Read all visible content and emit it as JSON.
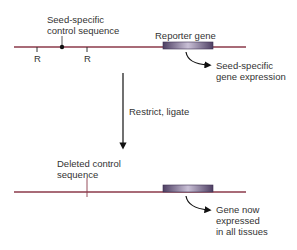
{
  "diagram": {
    "top": {
      "control_label_line1": "Seed-specific",
      "control_label_line2": "control sequence",
      "restriction_site_label": "R",
      "reporter_label": "Reporter gene",
      "expression_line1": "Seed-specific",
      "expression_line2": "gene expression"
    },
    "step": {
      "label": "Restrict, ligate"
    },
    "bottom": {
      "deleted_line1": "Deleted control",
      "deleted_line2": "sequence",
      "expression_line1": "Gene now",
      "expression_line2": "expressed",
      "expression_line3": "in all tissues"
    },
    "colors": {
      "dna_line": "#8b3a4a",
      "reporter_box": "#6a5a80",
      "text": "#333333"
    }
  }
}
